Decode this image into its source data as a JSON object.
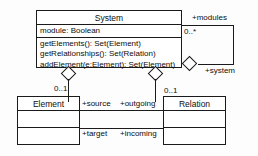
{
  "diagram": {
    "kind": "uml-class-diagram",
    "background_color": "#fdfdfd",
    "line_color": "#1a1a1a",
    "text_color": "#0d0d0d"
  },
  "classes": {
    "system": {
      "name": "System",
      "attributes": [
        "module: Boolean"
      ],
      "operations": [
        "getElements(): Set(Element)",
        "getRelationships(): Set(Relation)",
        "addElement(e:Element): Set(Element)"
      ]
    },
    "element": {
      "name": "Element",
      "attributes": [],
      "operations": []
    },
    "relation": {
      "name": "Relation",
      "attributes": [],
      "operations": []
    }
  },
  "associations": {
    "modules_self": {
      "role_far": "+modules",
      "multiplicity_far": "0..*",
      "role_near": "+system"
    },
    "system_element": {
      "multiplicity": "0..1"
    },
    "system_relation": {
      "multiplicity": "0..1"
    },
    "source_outgoing": {
      "role_a": "+source",
      "role_b": "+outgoing"
    },
    "target_incoming": {
      "role_a": "+target",
      "role_b": "+incoming"
    }
  }
}
